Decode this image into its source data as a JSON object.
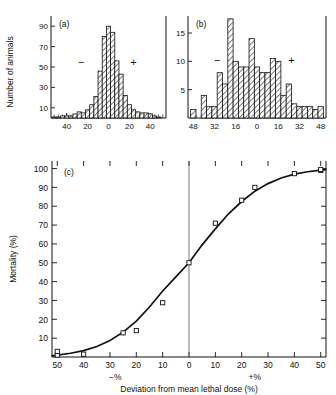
{
  "figure": {
    "background": "#ffffff",
    "ink_color": "#111111"
  },
  "chart_data": [
    {
      "type": "bar",
      "panel": "(a)",
      "title": "",
      "xlabel": "",
      "ylabel": "Number of animals",
      "ylim": [
        0,
        100
      ],
      "xlim": [
        -55,
        55
      ],
      "grid": false,
      "ytick_labels": [
        "10",
        "30",
        "50",
        "70",
        "90"
      ],
      "ytick_values": [
        10,
        30,
        50,
        70,
        90
      ],
      "xtick_labels": [
        "40",
        "20",
        "0",
        "20",
        "40"
      ],
      "xtick_values": [
        -40,
        -20,
        0,
        20,
        40
      ],
      "bin_width": 4,
      "annotations": [
        {
          "text": "−",
          "x": -26,
          "y": 51
        },
        {
          "text": "+",
          "x": 24,
          "y": 51
        }
      ],
      "categories": [
        -52,
        -48,
        -44,
        -40,
        -36,
        -32,
        -28,
        -24,
        -20,
        -16,
        -12,
        -8,
        -4,
        0,
        4,
        8,
        12,
        16,
        20,
        24,
        28,
        32,
        36,
        40,
        44,
        48
      ],
      "values": [
        1,
        1,
        2,
        2,
        2,
        4,
        6,
        5,
        8,
        13,
        21,
        46,
        80,
        90,
        84,
        56,
        43,
        22,
        13,
        8,
        6,
        5,
        5,
        4,
        2,
        1
      ]
    },
    {
      "type": "bar",
      "panel": "(b)",
      "title": "",
      "xlabel": "",
      "ylabel": "Number of animals",
      "ylim": [
        0,
        18
      ],
      "xlim": [
        -52,
        52
      ],
      "grid": false,
      "ytick_labels": [
        "5",
        "10",
        "15"
      ],
      "ytick_values": [
        5,
        10,
        15
      ],
      "xtick_labels": [
        "48",
        "32",
        "16",
        "0",
        "16",
        "32",
        "48"
      ],
      "xtick_values": [
        -48,
        -32,
        -16,
        0,
        16,
        32,
        48
      ],
      "bin_width": 4,
      "annotations": [
        {
          "text": "−",
          "x": -30,
          "y": 9.5
        },
        {
          "text": "+",
          "x": 26,
          "y": 9.5
        }
      ],
      "categories": [
        -48,
        -44,
        -40,
        -36,
        -32,
        -28,
        -24,
        -20,
        -16,
        -12,
        -8,
        -4,
        0,
        4,
        8,
        12,
        16,
        20,
        24,
        28,
        32,
        36,
        40,
        44,
        48
      ],
      "values": [
        1.5,
        0,
        4,
        2,
        2,
        8,
        6,
        17.5,
        10,
        9,
        9,
        14,
        9,
        8,
        8,
        10.5,
        10,
        4,
        6,
        2.5,
        2,
        2,
        2,
        1.5,
        2
      ]
    },
    {
      "type": "line",
      "panel": "(c)",
      "title": "",
      "xlabel": "Deviation from  mean lethal dose (%)",
      "ylabel": "Mortality (%)",
      "xlim": [
        -52,
        52
      ],
      "ylim": [
        0,
        104
      ],
      "grid": false,
      "legend": "none",
      "xtick_labels": [
        "50",
        "40",
        "30",
        "20",
        "10",
        "0",
        "10",
        "20",
        "30",
        "40",
        "50"
      ],
      "xtick_values": [
        -50,
        -40,
        -30,
        -20,
        -10,
        0,
        10,
        20,
        30,
        40,
        50
      ],
      "ytick_labels": [
        "10",
        "20",
        "30",
        "40",
        "50",
        "60",
        "70",
        "80",
        "90",
        "100"
      ],
      "ytick_values": [
        10,
        20,
        30,
        40,
        50,
        60,
        70,
        80,
        90,
        100
      ],
      "axis_side_labels": [
        {
          "text": "−%",
          "x": -28
        },
        {
          "text": "+%",
          "x": 25
        }
      ],
      "series": [
        {
          "name": "fitted sigmoid",
          "kind": "curve",
          "x": [
            -52,
            -50,
            -45,
            -40,
            -35,
            -30,
            -25,
            -20,
            -15,
            -10,
            -5,
            0,
            5,
            10,
            15,
            20,
            25,
            30,
            35,
            40,
            45,
            50,
            52
          ],
          "y": [
            0.6,
            1.0,
            2.0,
            3.4,
            5.6,
            8.8,
            13.2,
            19.0,
            26.5,
            35.0,
            42.5,
            50.0,
            59.5,
            68.0,
            76.0,
            82.5,
            88.0,
            92.0,
            95.0,
            97.0,
            98.3,
            99.2,
            99.4
          ]
        },
        {
          "name": "observed points",
          "kind": "markers",
          "marker": "open-square",
          "x": [
            -50,
            -50,
            -40,
            -25,
            -20,
            -10,
            0,
            10,
            20,
            25,
            40,
            50,
            50
          ],
          "y": [
            1.0,
            3.0,
            1.5,
            12.8,
            14.0,
            28.8,
            50.0,
            71.0,
            83.2,
            90.0,
            97.3,
            99.0,
            99.5
          ]
        }
      ]
    }
  ],
  "labels": {
    "y_axis_top": "Number of animals",
    "panel_a": "(a)",
    "panel_b": "(b)",
    "panel_c": "(c)",
    "y_axis_c": "Mortality (%)",
    "x_axis_c": "Deviation from  mean lethal dose (%)",
    "minus_sign": "−",
    "plus_sign": "+",
    "neg_percent": "−%",
    "pos_percent": "+%"
  }
}
